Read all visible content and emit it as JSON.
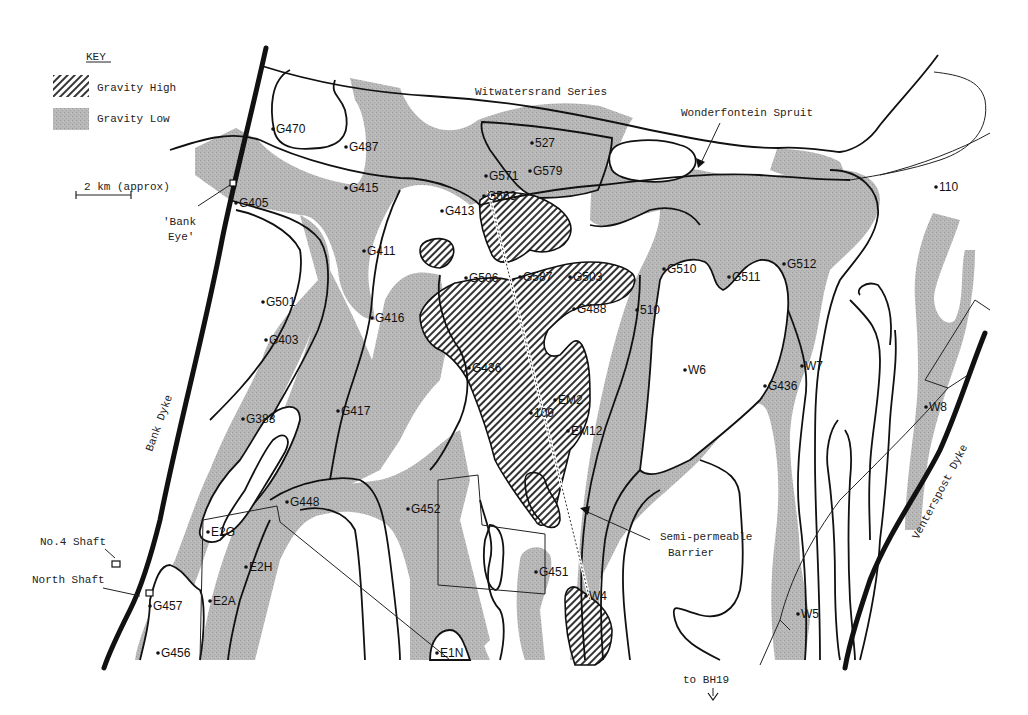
{
  "key": {
    "title": "KEY",
    "items": [
      {
        "label": "Gravity High",
        "pattern": "diagonal-hatch"
      },
      {
        "label": "Gravity Low",
        "pattern": "stipple-grey"
      }
    ]
  },
  "scale_bar": {
    "label": "2 km (approx)"
  },
  "region_labels": {
    "series": "Witwatersrand Series",
    "spruit": "Wonderfontein Spruit",
    "bank_dyke": "Bank Dyke",
    "venterspost_dyke": "Venterspost Dyke",
    "bank_eye_1": "'Bank",
    "bank_eye_2": "Eye'",
    "no4_shaft": "No.4 Shaft",
    "north_shaft": "North Shaft",
    "barrier_1": "Semi-permeable",
    "barrier_2": "Barrier",
    "bh19": "to BH19"
  },
  "colors": {
    "gravity_low_fill": "#b8b8b8",
    "line": "#111111",
    "background": "#ffffff"
  },
  "points": [
    {
      "id": "G470",
      "x": 273,
      "y": 129
    },
    {
      "id": "G487",
      "x": 346,
      "y": 147
    },
    {
      "id": "G415",
      "x": 346,
      "y": 188
    },
    {
      "id": "G405",
      "x": 236,
      "y": 203
    },
    {
      "id": "527",
      "x": 532,
      "y": 143
    },
    {
      "id": "G579",
      "x": 530,
      "y": 171
    },
    {
      "id": "G571",
      "x": 486,
      "y": 176
    },
    {
      "id": "G563",
      "x": 484,
      "y": 196
    },
    {
      "id": "G413",
      "x": 442,
      "y": 211
    },
    {
      "id": "G411",
      "x": 364,
      "y": 251
    },
    {
      "id": "G506",
      "x": 466,
      "y": 278
    },
    {
      "id": "G587",
      "x": 520,
      "y": 277
    },
    {
      "id": "G503",
      "x": 570,
      "y": 277
    },
    {
      "id": "G488",
      "x": 574,
      "y": 309
    },
    {
      "id": "510",
      "x": 637,
      "y": 310
    },
    {
      "id": "G510",
      "x": 664,
      "y": 269
    },
    {
      "id": "G511",
      "x": 729,
      "y": 277
    },
    {
      "id": "G512",
      "x": 784,
      "y": 264
    },
    {
      "id": "110",
      "x": 936,
      "y": 187
    },
    {
      "id": "G501",
      "x": 263,
      "y": 302
    },
    {
      "id": "G403",
      "x": 266,
      "y": 340
    },
    {
      "id": "G416",
      "x": 372,
      "y": 318
    },
    {
      "id": "G436 (centre)",
      "x": 469,
      "y": 368
    },
    {
      "id": "W6",
      "x": 685,
      "y": 370
    },
    {
      "id": "W7",
      "x": 802,
      "y": 366
    },
    {
      "id": "G436",
      "x": 765,
      "y": 386
    },
    {
      "id": "W8",
      "x": 926,
      "y": 407
    },
    {
      "id": "G383",
      "x": 243,
      "y": 419
    },
    {
      "id": "G417",
      "x": 338,
      "y": 411
    },
    {
      "id": "109",
      "x": 531,
      "y": 413
    },
    {
      "id": "EM2",
      "x": 555,
      "y": 400
    },
    {
      "id": "EM12",
      "x": 568,
      "y": 431
    },
    {
      "id": "G448",
      "x": 287,
      "y": 502
    },
    {
      "id": "G452",
      "x": 408,
      "y": 509
    },
    {
      "id": "E2G",
      "x": 208,
      "y": 532
    },
    {
      "id": "E2H",
      "x": 246,
      "y": 567
    },
    {
      "id": "G451",
      "x": 536,
      "y": 572
    },
    {
      "id": "W4",
      "x": 586,
      "y": 596
    },
    {
      "id": "G457",
      "x": 150,
      "y": 606
    },
    {
      "id": "E2A",
      "x": 210,
      "y": 601
    },
    {
      "id": "W5",
      "x": 798,
      "y": 614
    },
    {
      "id": "G456",
      "x": 158,
      "y": 653
    },
    {
      "id": "E1N",
      "x": 437,
      "y": 653
    }
  ]
}
